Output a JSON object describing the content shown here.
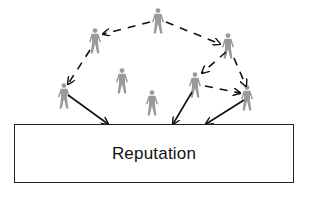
{
  "diagram": {
    "box_label": "Reputation",
    "colors": {
      "person": "#9a9a9a",
      "arrow": "#111111",
      "box_border": "#222222",
      "background": "#ffffff"
    },
    "people": [
      {
        "id": "p-top",
        "x": 158,
        "y": 8
      },
      {
        "id": "p-upper-left",
        "x": 95,
        "y": 28
      },
      {
        "id": "p-upper-right",
        "x": 228,
        "y": 33
      },
      {
        "id": "p-left",
        "x": 64,
        "y": 83
      },
      {
        "id": "p-mid-left",
        "x": 122,
        "y": 68
      },
      {
        "id": "p-mid",
        "x": 152,
        "y": 90
      },
      {
        "id": "p-right-mid",
        "x": 195,
        "y": 72
      },
      {
        "id": "p-right",
        "x": 247,
        "y": 85
      }
    ],
    "dashed_arrows": [
      {
        "from": "p-top",
        "to": "p-upper-left",
        "x1": 150,
        "y1": 22,
        "x2": 103,
        "y2": 34
      },
      {
        "from": "p-top",
        "to": "p-upper-right",
        "x1": 166,
        "y1": 22,
        "x2": 220,
        "y2": 44
      },
      {
        "from": "p-upper-left",
        "to": "p-left",
        "x1": 90,
        "y1": 50,
        "x2": 68,
        "y2": 84
      },
      {
        "from": "p-upper-right",
        "to": "p-right-mid",
        "x1": 226,
        "y1": 52,
        "x2": 202,
        "y2": 73
      },
      {
        "from": "p-upper-right",
        "to": "p-right",
        "x1": 234,
        "y1": 58,
        "x2": 246,
        "y2": 86
      },
      {
        "from": "p-right-mid",
        "to": "p-right",
        "x1": 205,
        "y1": 86,
        "x2": 240,
        "y2": 93
      }
    ],
    "solid_arrows": [
      {
        "from": "p-left",
        "to": "box",
        "x1": 68,
        "y1": 95,
        "x2": 108,
        "y2": 124
      },
      {
        "from": "p-right-mid",
        "to": "box",
        "x1": 192,
        "y1": 92,
        "x2": 173,
        "y2": 124
      },
      {
        "from": "p-right",
        "to": "box",
        "x1": 244,
        "y1": 100,
        "x2": 206,
        "y2": 124
      }
    ]
  }
}
